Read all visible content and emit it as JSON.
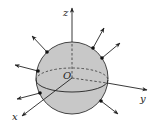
{
  "diagram": {
    "title": "",
    "labels": {
      "z_axis": "z",
      "y_axis": "y",
      "x_axis": "x",
      "origin": "O"
    },
    "colors": {
      "sphere_fill": "#c8c8c8",
      "stroke": "#222222",
      "background": "#ffffff"
    },
    "normal_vectors_count": 6
  }
}
